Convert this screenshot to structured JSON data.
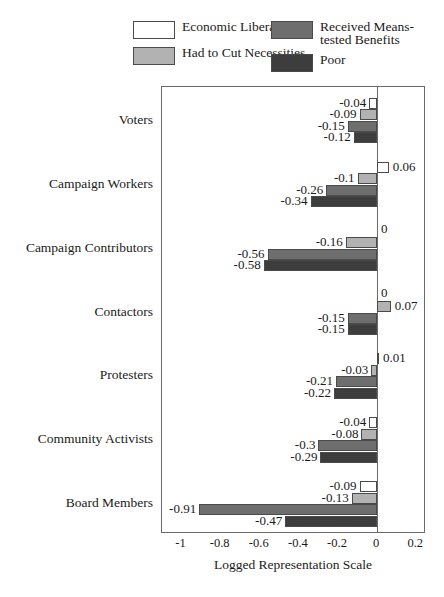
{
  "chart_data": {
    "type": "bar",
    "orientation": "horizontal",
    "title": "",
    "xlabel": "Logged Representation Scale",
    "ylabel": "",
    "xlim": [
      -1.1,
      0.25
    ],
    "xticks": [
      -1,
      -0.8,
      -0.6,
      -0.4,
      -0.2,
      0,
      0.2
    ],
    "xtick_labels": [
      "-1",
      "-0.8",
      "-0.6",
      "-0.4",
      "-0.2",
      "0",
      "0.2"
    ],
    "grid": false,
    "legend_position": "top",
    "categories": [
      "Voters",
      "Campaign Workers",
      "Campaign Contributors",
      "Contactors",
      "Protesters",
      "Community Activists",
      "Board Members"
    ],
    "series": [
      {
        "name": "Economic Liberal",
        "color": "#ffffff",
        "values": [
          -0.04,
          0.06,
          0,
          0,
          0.01,
          -0.04,
          -0.09
        ],
        "labels": [
          "-0.04",
          "0.06",
          "0",
          "0",
          "0.01",
          "-0.04",
          "-0.09"
        ]
      },
      {
        "name": "Had to Cut Necessities",
        "color": "#b2b2b2",
        "values": [
          -0.09,
          -0.1,
          -0.16,
          0.07,
          -0.03,
          -0.08,
          -0.13
        ],
        "labels": [
          "-0.09",
          "-0.1",
          "-0.16",
          "0.07",
          "-0.03",
          "-0.08",
          "-0.13"
        ]
      },
      {
        "name": "Received Means-tested Benefits",
        "color": "#6e6e6e",
        "values": [
          -0.15,
          -0.26,
          -0.56,
          -0.15,
          -0.21,
          -0.3,
          -0.91
        ],
        "labels": [
          "-0.15",
          "-0.26",
          "-0.56",
          "-0.15",
          "-0.21",
          "-0.3",
          "-0.91"
        ]
      },
      {
        "name": "Poor",
        "color": "#3d3d3d",
        "values": [
          -0.12,
          -0.34,
          -0.58,
          -0.15,
          -0.22,
          -0.29,
          -0.47
        ],
        "labels": [
          "-0.12",
          "-0.34",
          "-0.58",
          "-0.15",
          "-0.22",
          "-0.29",
          "-0.47"
        ]
      }
    ]
  },
  "legend": {
    "entries": [
      {
        "label": "Economic Liberal",
        "color": "#ffffff",
        "column": "left"
      },
      {
        "label": "Had to Cut Necessities",
        "color": "#b2b2b2",
        "column": "left"
      },
      {
        "label": "Received Means-\ntested Benefits",
        "color": "#6e6e6e",
        "column": "right"
      },
      {
        "label": "Poor",
        "color": "#3d3d3d",
        "column": "right"
      }
    ]
  }
}
